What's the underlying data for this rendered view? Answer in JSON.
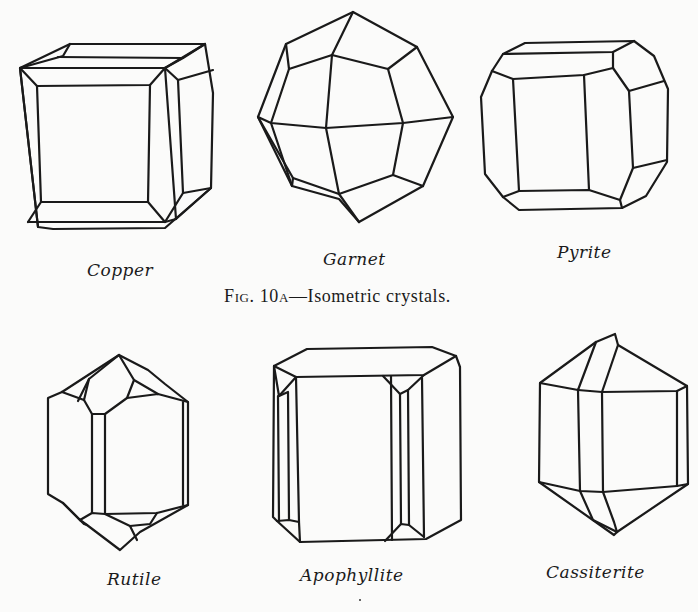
{
  "figure": {
    "caption": {
      "prefix_cap": "F",
      "prefix_sc": "IG",
      "number_main": ". 10",
      "number_sc": "A",
      "text": "—Isometric crystals."
    },
    "crystals": [
      {
        "id": "copper",
        "name": "Copper",
        "row": 1
      },
      {
        "id": "garnet",
        "name": "Garnet",
        "row": 1
      },
      {
        "id": "pyrite",
        "name": "Pyrite",
        "row": 1
      },
      {
        "id": "rutile",
        "name": "Rutile",
        "row": 2
      },
      {
        "id": "apophyllite",
        "name": "Apophyllite",
        "row": 2
      },
      {
        "id": "cassiterite",
        "name": "Cassiterite",
        "row": 2
      }
    ],
    "ink_color": "#1a1a1a",
    "paper_color": "#fbfbfa"
  }
}
